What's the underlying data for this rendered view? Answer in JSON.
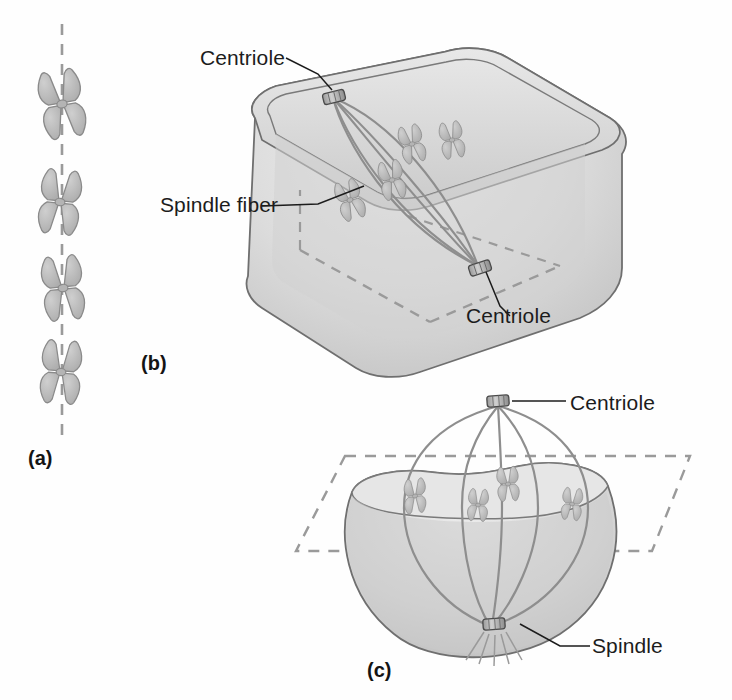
{
  "figure": {
    "background_color": "#ffffff",
    "ink_color": "#1c1c1c",
    "cell_fill": "#d8d8d8",
    "cell_shade": "#bdbdbd",
    "chromosome_fill": "#b9b9b9",
    "chromosome_stroke": "#8a8a8a",
    "dashed_color": "#9a9a9a",
    "fiber_color": "#8e8e8e"
  },
  "panels": [
    {
      "id": "a",
      "letter": "(a)",
      "description": "Vertical column of four X-shaped chromosomes aligned along a dashed metaphase axis",
      "chromosome_count": 4,
      "axis": "dashed vertical line"
    },
    {
      "id": "b",
      "letter": "(b)",
      "description": "Three-dimensional rounded-box cell showing spindle apparatus with two centrioles at opposite poles and chromosomes at the equatorial plate",
      "chromosome_count": 4,
      "centriole_count": 2,
      "equatorial_plane": "dashed"
    },
    {
      "id": "c",
      "letter": "(c)",
      "description": "Cut-away bowl view of a cell with spindle fibers running from top centriole through the equatorial plate to the bottom spindle pole",
      "chromosome_count": 4,
      "centriole_count": 2,
      "equatorial_plane": "dashed parallelogram"
    }
  ],
  "callouts": {
    "centriole_b_top": "Centriole",
    "spindle_fiber": "Spindle fiber",
    "centriole_b_bottom": "Centriole",
    "centriole_c": "Centriole",
    "spindle_c": "Spindle"
  },
  "icons": {
    "chromosome": "chromosome-icon",
    "centriole": "centriole-icon",
    "spindle_fiber": "spindle-fiber-icon",
    "leader_line": "leader-line-icon"
  }
}
